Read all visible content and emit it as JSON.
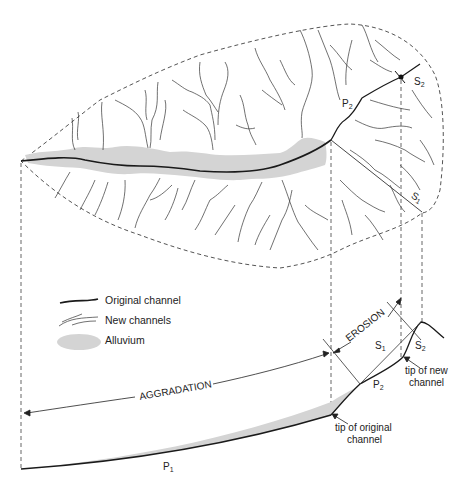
{
  "diagram": {
    "type": "drainage-basin-evolution",
    "legend": {
      "items": [
        {
          "key": "original_channel",
          "label": "Original channel",
          "symbol": "thick-line"
        },
        {
          "key": "new_channels",
          "label": "New channels",
          "symbol": "thin-branching-lines"
        },
        {
          "key": "alluvium",
          "label": "Alluvium",
          "symbol": "gray-ellipse"
        }
      ]
    },
    "plan_view": {
      "labels": {
        "p2": {
          "base": "P",
          "sub": "2"
        },
        "s1": {
          "base": "S",
          "sub": "1"
        },
        "s2": {
          "base": "S",
          "sub": "2"
        }
      }
    },
    "profile_view": {
      "labels": {
        "aggradation": "AGGRADATION",
        "erosion": "EROSION",
        "p1": {
          "base": "P",
          "sub": "1"
        },
        "p2": {
          "base": "P",
          "sub": "2"
        },
        "s1": {
          "base": "S",
          "sub": "1"
        },
        "s2": {
          "base": "S",
          "sub": "2"
        },
        "tip_original_line1": "tip of original",
        "tip_original_line2": "channel",
        "tip_new_line1": "tip of new",
        "tip_new_line2": "channel"
      }
    },
    "colors": {
      "line": "#1a1a1a",
      "thin_line": "#333333",
      "dashed": "#555555",
      "alluvium": "#d4d4d4"
    }
  }
}
